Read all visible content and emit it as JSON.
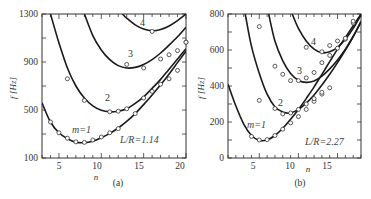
{
  "chart_data": [
    {
      "type": "line",
      "panel": "(a)",
      "xlabel": "n",
      "ylabel": "f [Hz]",
      "xlim": [
        3,
        20
      ],
      "ylim": [
        100,
        1300
      ],
      "xticks": [
        5,
        10,
        15,
        20
      ],
      "yticks": [
        100,
        500,
        900,
        1300
      ],
      "annotation": "L/R=1.14",
      "series": [
        {
          "name": "m=1",
          "label": "m=1",
          "curve": [
            [
              3,
              560
            ],
            [
              4,
              400
            ],
            [
              5,
              310
            ],
            [
              6,
              260
            ],
            [
              7,
              232
            ],
            [
              8,
              228
            ],
            [
              9,
              240
            ],
            [
              10,
              268
            ],
            [
              11,
              305
            ],
            [
              12,
              350
            ],
            [
              13,
              405
            ],
            [
              14,
              470
            ],
            [
              15,
              545
            ],
            [
              16,
              625
            ],
            [
              17,
              710
            ],
            [
              18,
              800
            ],
            [
              19,
              895
            ],
            [
              20,
              990
            ]
          ],
          "points": [
            [
              4,
              400
            ],
            [
              5,
              310
            ],
            [
              6,
              265
            ],
            [
              7,
              235
            ],
            [
              8,
              230
            ],
            [
              9,
              250
            ],
            [
              10,
              275
            ],
            [
              11,
              310
            ],
            [
              12,
              345
            ],
            [
              14,
              470
            ]
          ]
        },
        {
          "name": "m=2",
          "label": "2",
          "curve": [
            [
              4,
              1300
            ],
            [
              5,
              1060
            ],
            [
              6,
              850
            ],
            [
              7,
              700
            ],
            [
              8,
              600
            ],
            [
              9,
              535
            ],
            [
              10,
              498
            ],
            [
              11,
              485
            ],
            [
              12,
              490
            ],
            [
              13,
              510
            ],
            [
              14,
              555
            ],
            [
              15,
              610
            ],
            [
              16,
              680
            ],
            [
              17,
              755
            ],
            [
              18,
              840
            ],
            [
              19,
              925
            ],
            [
              20,
              1010
            ]
          ],
          "points": [
            [
              6,
              760
            ],
            [
              8,
              580
            ],
            [
              11,
              485
            ],
            [
              12,
              490
            ],
            [
              13,
              510
            ],
            [
              15,
              600
            ],
            [
              16,
              655
            ],
            [
              17,
              715
            ],
            [
              18,
              760
            ],
            [
              19,
              830
            ]
          ]
        },
        {
          "name": "m=3",
          "label": "3",
          "curve": [
            [
              8,
              1300
            ],
            [
              9,
              1120
            ],
            [
              10,
              1000
            ],
            [
              11,
              920
            ],
            [
              12,
              870
            ],
            [
              13,
              850
            ],
            [
              14,
              855
            ],
            [
              15,
              880
            ],
            [
              16,
              920
            ],
            [
              17,
              975
            ],
            [
              18,
              1040
            ],
            [
              19,
              1110
            ],
            [
              20,
              1190
            ]
          ],
          "points": [
            [
              13,
              880
            ],
            [
              15,
              850
            ],
            [
              17,
              925
            ],
            [
              18,
              960
            ],
            [
              19,
              995
            ],
            [
              20,
              1065
            ]
          ]
        },
        {
          "name": "m=4",
          "label": "4",
          "curve": [
            [
              12.5,
              1300
            ],
            [
              13,
              1265
            ],
            [
              14,
              1210
            ],
            [
              15,
              1175
            ],
            [
              16,
              1160
            ],
            [
              17,
              1170
            ],
            [
              18,
              1200
            ],
            [
              19,
              1245
            ],
            [
              20,
              1300
            ]
          ],
          "points": [
            [
              16,
              1155
            ],
            [
              20,
              1065
            ]
          ]
        }
      ]
    },
    {
      "type": "line",
      "panel": "(b)",
      "xlabel": "n",
      "ylabel": "f [Hz]",
      "xlim": [
        1,
        18
      ],
      "ylim": [
        0,
        800
      ],
      "xticks": [
        5,
        10,
        15
      ],
      "yticks": [
        0,
        200,
        400,
        600,
        800
      ],
      "annotation": "L/R=2.27",
      "series": [
        {
          "name": "m=1",
          "label": "m=1",
          "curve": [
            [
              1,
              410
            ],
            [
              2,
              290
            ],
            [
              3,
              190
            ],
            [
              4,
              125
            ],
            [
              5,
              98
            ],
            [
              6,
              100
            ],
            [
              7,
              125
            ],
            [
              8,
              165
            ],
            [
              9,
              215
            ],
            [
              10,
              270
            ],
            [
              11,
              330
            ],
            [
              12,
              395
            ],
            [
              13,
              465
            ],
            [
              14,
              535
            ],
            [
              15,
              605
            ],
            [
              16,
              670
            ],
            [
              17,
              735
            ],
            [
              18,
              800
            ]
          ],
          "points": [
            [
              4,
              120
            ],
            [
              5,
              100
            ],
            [
              6,
              102
            ],
            [
              7,
              125
            ],
            [
              8,
              160
            ],
            [
              9,
              195
            ],
            [
              10,
              230
            ],
            [
              11,
              270
            ],
            [
              12,
              315
            ],
            [
              13,
              355
            ]
          ]
        },
        {
          "name": "m=2",
          "label": "2",
          "curve": [
            [
              3.2,
              800
            ],
            [
              4,
              620
            ],
            [
              5,
              470
            ],
            [
              6,
              355
            ],
            [
              7,
              285
            ],
            [
              8,
              255
            ],
            [
              9,
              250
            ],
            [
              10,
              270
            ],
            [
              11,
              305
            ],
            [
              12,
              350
            ],
            [
              13,
              405
            ],
            [
              14,
              465
            ],
            [
              15,
              530
            ],
            [
              16,
              600
            ],
            [
              17,
              675
            ],
            [
              18,
              760
            ]
          ],
          "points": [
            [
              5,
              320
            ],
            [
              7,
              275
            ],
            [
              8,
              245
            ],
            [
              9,
              250
            ],
            [
              10,
              270
            ],
            [
              11,
              300
            ],
            [
              12,
              330
            ],
            [
              13,
              365
            ],
            [
              14,
              390
            ]
          ]
        },
        {
          "name": "m=3",
          "label": "3",
          "curve": [
            [
              6.2,
              800
            ],
            [
              7,
              650
            ],
            [
              8,
              540
            ],
            [
              9,
              470
            ],
            [
              10,
              432
            ],
            [
              11,
              420
            ],
            [
              12,
              428
            ],
            [
              13,
              455
            ],
            [
              14,
              495
            ],
            [
              15,
              545
            ],
            [
              16,
              605
            ],
            [
              17,
              675
            ],
            [
              18,
              755
            ]
          ],
          "points": [
            [
              5,
              730
            ],
            [
              7,
              510
            ],
            [
              8,
              465
            ],
            [
              9,
              430
            ],
            [
              10,
              430
            ],
            [
              11,
              445
            ],
            [
              12,
              475
            ],
            [
              13,
              530
            ],
            [
              14,
              570
            ],
            [
              15,
              610
            ],
            [
              16,
              660
            ],
            [
              17,
              750
            ]
          ],
          "points_note": "approximate"
        },
        {
          "name": "m=4",
          "label": "4",
          "curve": [
            [
              9.2,
              800
            ],
            [
              10,
              720
            ],
            [
              11,
              650
            ],
            [
              12,
              605
            ],
            [
              13,
              585
            ],
            [
              14,
              590
            ],
            [
              15,
              615
            ],
            [
              16,
              660
            ],
            [
              17,
              720
            ],
            [
              18,
              795
            ]
          ],
          "points": [
            [
              11,
              615
            ],
            [
              13,
              590
            ],
            [
              14,
              625
            ],
            [
              15,
              650
            ],
            [
              16,
              665
            ],
            [
              17,
              760
            ]
          ]
        }
      ]
    }
  ],
  "panels": {
    "a": {
      "label": "(a)",
      "ylabel": "f [Hz]",
      "xlabel": "n",
      "annotation": "L/R=1.14",
      "yticks": [
        "100",
        "500",
        "900",
        "1300"
      ],
      "xticks": [
        "5",
        "10",
        "15",
        "20"
      ],
      "curve_labels": [
        "m=1",
        "2",
        "3",
        "4"
      ]
    },
    "b": {
      "label": "(b)",
      "ylabel": "f [Hz]",
      "xlabel": "n",
      "annotation": "L/R=2.27",
      "yticks": [
        "0",
        "200",
        "400",
        "600",
        "800"
      ],
      "xticks": [
        "5",
        "10",
        "15"
      ],
      "curve_labels": [
        "m=1",
        "2",
        "3",
        "4"
      ]
    }
  },
  "colors": {
    "line": "#1a1a1a",
    "marker_fill": "#ffffff",
    "marker_stroke": "#333333",
    "frame": "#333333"
  }
}
